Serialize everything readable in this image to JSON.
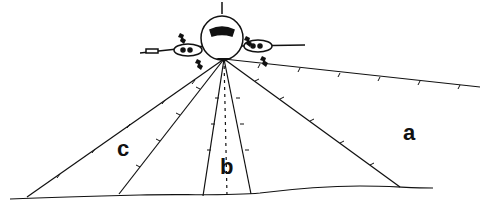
{
  "diagram": {
    "labels": [
      {
        "id": "c",
        "text": "c",
        "x": 117,
        "y": 138
      },
      {
        "id": "b",
        "text": "b",
        "x": 220,
        "y": 156
      },
      {
        "id": "a",
        "text": "a",
        "x": 403,
        "y": 122
      }
    ],
    "colors": {
      "ink": "#111111",
      "background": "#ffffff"
    }
  }
}
